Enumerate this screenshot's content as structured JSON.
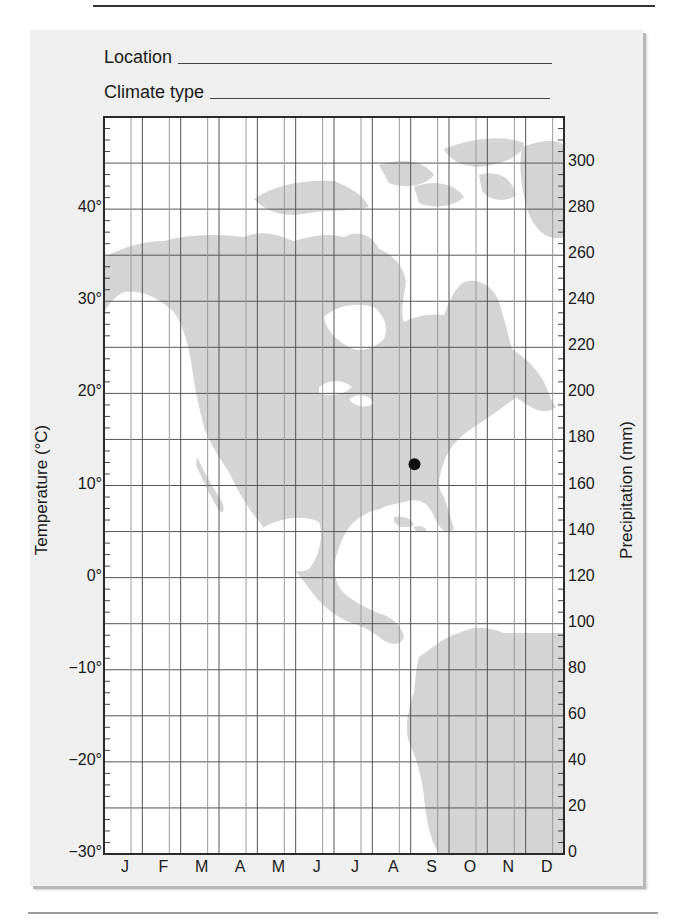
{
  "form": {
    "location_label": "Location",
    "climate_type_label": "Climate type"
  },
  "chart_data": {
    "type": "scatter",
    "title": "",
    "xlabel": "",
    "ylabel": "Temperature (°C)",
    "ylabel_right": "Precipitation (mm)",
    "categories": [
      "J",
      "F",
      "M",
      "A",
      "M",
      "J",
      "J",
      "A",
      "S",
      "O",
      "N",
      "D"
    ],
    "ylim": [
      -30,
      50
    ],
    "ylim_right": [
      0,
      320
    ],
    "y_ticks": [
      "40°",
      "30°",
      "20°",
      "10°",
      "0°",
      "−10°",
      "−20°",
      "−30°"
    ],
    "y_tick_values": [
      40,
      30,
      20,
      10,
      0,
      -10,
      -20,
      -30
    ],
    "y_right_ticks": [
      "300",
      "280",
      "260",
      "240",
      "220",
      "200",
      "180",
      "160",
      "140",
      "120",
      "100",
      "80",
      "60",
      "40",
      "20",
      "0"
    ],
    "y_right_tick_values": [
      300,
      280,
      260,
      240,
      220,
      200,
      180,
      160,
      140,
      120,
      100,
      80,
      60,
      40,
      20,
      0
    ],
    "grid": true,
    "background": "map of North and Central America and northern South America (light gray)",
    "series": [
      {
        "name": "location marker",
        "points": [
          {
            "x_month_index": 8.1,
            "temperature": 12.3
          }
        ]
      }
    ],
    "series_temperature": [],
    "series_precipitation": []
  },
  "colors": {
    "land": "#d4d4d4",
    "panel": "#efefef",
    "grid_dark": "#555555",
    "grid_light": "#9a9a9a",
    "marker": "#111111"
  }
}
